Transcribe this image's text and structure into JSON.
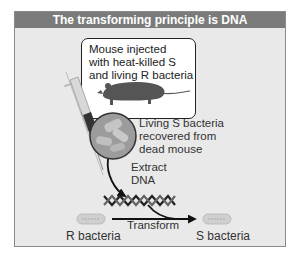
{
  "figure": {
    "title": "The transforming principle is DNA",
    "mouse_caption": "Mouse injected\nwith heat-killed S\nand living R bacteria",
    "recovered_caption": "Living S bacteria\nrecovered from\ndead mouse",
    "extract_label": "Extract\nDNA",
    "transform_label": "Transform",
    "r_bacteria_label": "R bacteria",
    "s_bacteria_label": "S bacteria"
  },
  "colors": {
    "header_bg": "#7b7b7b",
    "panel_bg": "#e9e9e9",
    "text": "#333333"
  }
}
